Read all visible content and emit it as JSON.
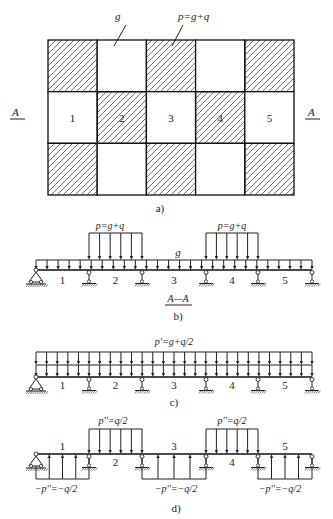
{
  "figure_a": {
    "caption": "a)",
    "label_g": "g",
    "label_p": "p=g+q",
    "section_marker_left": "A",
    "section_marker_right": "A",
    "grid": {
      "rows": 3,
      "cols": 5,
      "x0": 48,
      "y0": 40,
      "x1": 294,
      "y1": 195
    },
    "hatched_pattern": [
      [
        true,
        false,
        true,
        false,
        true
      ],
      [
        false,
        true,
        false,
        true,
        false
      ],
      [
        true,
        false,
        true,
        false,
        true
      ]
    ],
    "middle_row_numbers": [
      "1",
      "2",
      "3",
      "4",
      "5"
    ]
  },
  "figure_b": {
    "caption": "b)",
    "section_title": "A—A",
    "label_g": "g",
    "label_p1": "p=g+q",
    "label_p2": "p=g+q",
    "span_numbers": [
      "1",
      "2",
      "3",
      "4",
      "5"
    ],
    "loaded_spans": [
      2,
      4
    ]
  },
  "figure_c": {
    "caption": "c)",
    "label_p": "p'=g+q/2",
    "span_numbers": [
      "1",
      "2",
      "3",
      "4",
      "5"
    ]
  },
  "figure_d": {
    "caption": "d)",
    "label_down_1": "p''=q/2",
    "label_down_2": "p''=q/2",
    "label_up_1": "−p''=−q/2",
    "label_up_2": "−p''=−q/2",
    "label_up_3": "−p''=−q/2",
    "span_numbers": [
      "1",
      "2",
      "3",
      "4",
      "5"
    ],
    "downward_spans": [
      2,
      4
    ],
    "upward_spans": [
      1,
      3,
      5
    ]
  },
  "supports_x": [
    36,
    89,
    142,
    206,
    258,
    312
  ]
}
